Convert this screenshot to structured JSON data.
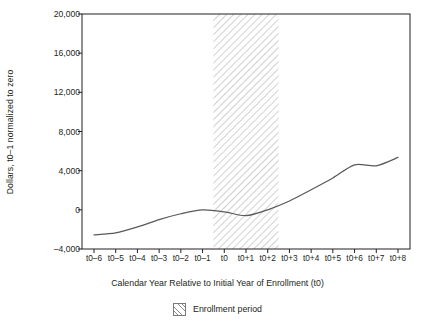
{
  "chart_data": {
    "type": "line",
    "title": "",
    "subtitle": "",
    "xlabel": "Calendar Year Relative to Initial Year of Enrollment (t0)",
    "ylabel": "Dollars, t0–1 normalized to zero",
    "categories": [
      "t0–6",
      "t0–5",
      "t0–4",
      "t0–3",
      "t0–2",
      "t0–1",
      "t0",
      "t0+1",
      "t0+2",
      "t0+3",
      "t0+4",
      "t0+5",
      "t0+6",
      "t0+7",
      "t0+8"
    ],
    "values": [
      -2550,
      -2350,
      -1750,
      -1000,
      -400,
      0,
      -200,
      -600,
      0,
      900,
      2050,
      3250,
      4600,
      4500,
      5350
    ],
    "series": [
      {
        "name": "Dollars normalized to zero",
        "values": [
          -2550,
          -2350,
          -1750,
          -1000,
          -400,
          0,
          -200,
          -600,
          0,
          900,
          2050,
          3250,
          4600,
          4500,
          5350
        ],
        "color": "#595959"
      }
    ],
    "ylim": [
      -4000,
      20000
    ],
    "yticks": [
      -4000,
      0,
      4000,
      8000,
      12000,
      16000,
      20000
    ],
    "ytick_labels": [
      "–4,000",
      "0",
      "4,000",
      "8,000",
      "12,000",
      "16,000",
      "20,000"
    ],
    "xtick_labels": [
      "t0–6",
      "t0–5",
      "t0–4",
      "t0–3",
      "t0–2",
      "t0–1",
      "t0",
      "t0+1",
      "t0+2",
      "t0+3",
      "t0+4",
      "t0+5",
      "t0+6",
      "t0+7",
      "t0+8"
    ],
    "grid": false,
    "legend_position": "below",
    "legend": [
      {
        "label": "Enrollment period",
        "style": "hatched-band",
        "color": "#8a8a8a"
      }
    ],
    "annotations": [
      {
        "type": "shaded-band",
        "label": "Enrollment period",
        "x_start": "t0–0.5",
        "x_end": "t0+2.5",
        "pattern": "diagonal-hatch"
      }
    ],
    "axis_color": "#231f20",
    "line_color": "#595959"
  }
}
